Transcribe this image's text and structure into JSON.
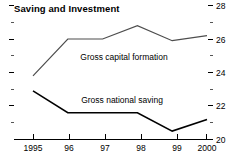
{
  "chart_data": {
    "type": "line",
    "title": "Saving and Investment",
    "xlabel": "",
    "ylabel": "",
    "x": [
      1995,
      1996,
      1997,
      1998,
      1999,
      2000
    ],
    "categories": [
      "1995",
      "96",
      "97",
      "98",
      "99",
      "2000"
    ],
    "series": [
      {
        "name": "Gross capital formation",
        "values": [
          23.8,
          26.0,
          26.0,
          26.8,
          25.9,
          26.2
        ],
        "color": "#4d4d4d"
      },
      {
        "name": "Gross national saving",
        "values": [
          22.9,
          21.6,
          21.6,
          21.6,
          20.5,
          21.2
        ],
        "color": "#000000"
      }
    ],
    "ylim": [
      20,
      28
    ],
    "y_ticks_major": [
      20,
      22,
      24,
      26,
      28
    ],
    "y_tick_labels": [
      "20",
      "22",
      "24",
      "26",
      "28"
    ],
    "y_ticks_minor": [
      21,
      23,
      25,
      27
    ],
    "y_axis_position": "right",
    "grid": false,
    "legend": "inline-annotations",
    "annotations": [
      {
        "text": "Gross capital formation",
        "x": 1997.0,
        "y": 25.45
      },
      {
        "text": "Gross national saving",
        "x": 1997.0,
        "y": 22.45
      }
    ]
  },
  "labels": {
    "title": "Saving and Investment",
    "x_1995": "1995",
    "x_1996": "96",
    "x_1997": "97",
    "x_1998": "98",
    "x_1999": "99",
    "x_2000": "2000",
    "y_28": "28",
    "y_26": "26",
    "y_24": "24",
    "y_22": "22",
    "y_20": "20",
    "series_upper": "Gross capital formation",
    "series_lower": "Gross national saving"
  }
}
